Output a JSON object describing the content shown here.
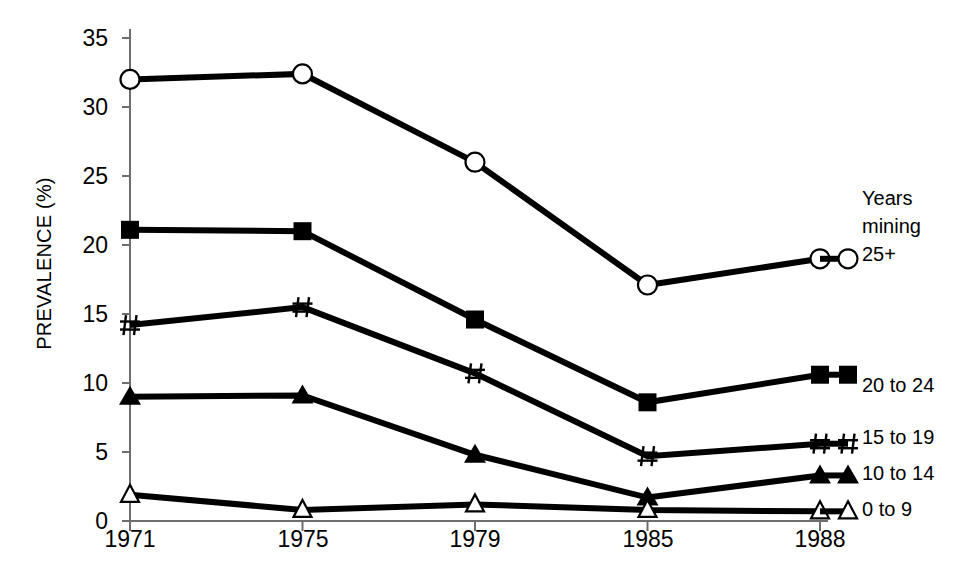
{
  "chart_data": {
    "type": "line",
    "title": "",
    "xlabel": "",
    "ylabel": "PREVALENCE (%)",
    "categories": [
      "1971",
      "1975",
      "1979",
      "1985",
      "1988"
    ],
    "ylim": [
      0,
      35
    ],
    "yticks": [
      0,
      5,
      10,
      15,
      20,
      25,
      30,
      35
    ],
    "grid": false,
    "legend_position": "right",
    "legend_title": [
      "Years",
      "mining"
    ],
    "series": [
      {
        "name": "25+",
        "marker": "open-circle",
        "values": [
          32.0,
          32.4,
          26.0,
          17.1,
          19.0
        ]
      },
      {
        "name": "20 to 24",
        "marker": "filled-square",
        "values": [
          21.1,
          21.0,
          14.6,
          8.6,
          10.6
        ]
      },
      {
        "name": "15 to 19",
        "marker": "hash",
        "values": [
          14.2,
          15.5,
          10.7,
          4.7,
          5.6
        ]
      },
      {
        "name": "10 to 14",
        "marker": "filled-triangle",
        "values": [
          9.0,
          9.1,
          4.8,
          1.7,
          3.3
        ]
      },
      {
        "name": "0 to 9",
        "marker": "open-triangle",
        "values": [
          1.9,
          0.8,
          1.2,
          0.8,
          0.7
        ]
      }
    ]
  },
  "axis": {
    "ytick_labels": [
      "35",
      "30",
      "25",
      "20",
      "15",
      "10",
      "5",
      "0"
    ],
    "xtick_labels": [
      "1971",
      "1975",
      "1979",
      "1985",
      "1988"
    ],
    "ylabel": "PREVALENCE (%)"
  },
  "legend": {
    "title_line1": "Years",
    "title_line2": "mining",
    "entries": [
      {
        "label": "25+"
      },
      {
        "label": "20 to 24"
      },
      {
        "label": "15 to 19"
      },
      {
        "label": "10 to 14"
      },
      {
        "label": "0 to 9"
      }
    ]
  },
  "colors": {
    "series": "#000000",
    "axis": "#6e6e6e",
    "text": "#1a1a1a",
    "background": "#ffffff"
  }
}
